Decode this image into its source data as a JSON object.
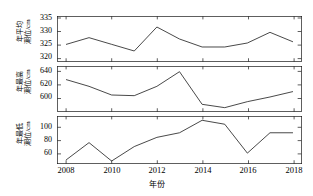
{
  "figure": {
    "xaxis_title": "年份",
    "background_color": "#ffffff",
    "line_color": "#1a1a1a"
  },
  "chart_data": [
    {
      "type": "line",
      "title": "",
      "panel_index": 1,
      "ylabel_line1": "年平均",
      "ylabel_line2": "潮位/cm",
      "ylabel": "年平均潮位/cm",
      "xlabel": "年份",
      "x": [
        2008,
        2009,
        2010,
        2011,
        2012,
        2013,
        2014,
        2015,
        2016,
        2017,
        2018
      ],
      "values": [
        325.5,
        328.0,
        325.5,
        323.0,
        332.0,
        327.5,
        324.5,
        324.5,
        326.0,
        330.0,
        326.5
      ],
      "xlim": [
        2007.6,
        2018.4
      ],
      "ylim": [
        319.0,
        336.0
      ],
      "yticks": [
        320,
        325,
        330,
        335
      ],
      "ytick_labels": [
        "320",
        "325",
        "330",
        "335"
      ],
      "xticks": [
        2008,
        2010,
        2012,
        2014,
        2016,
        2018
      ],
      "xtick_labels": [
        "2008",
        "2010",
        "2012",
        "2014",
        "2016",
        "2018"
      ],
      "grid": false,
      "legend": false
    },
    {
      "type": "line",
      "title": "",
      "panel_index": 2,
      "ylabel_line1": "年最高",
      "ylabel_line2": "潮位/cm",
      "ylabel": "年最高潮位/cm",
      "xlabel": "年份",
      "x": [
        2008,
        2009,
        2010,
        2011,
        2012,
        2013,
        2014,
        2015,
        2016,
        2017,
        2018
      ],
      "values": [
        628,
        618,
        605,
        604,
        618,
        640,
        591,
        586,
        595,
        602,
        610
      ],
      "xlim": [
        2007.6,
        2018.4
      ],
      "ylim": [
        580,
        648
      ],
      "yticks": [
        600,
        620,
        640
      ],
      "ytick_labels": [
        "600",
        "620",
        "640"
      ],
      "xticks": [
        2008,
        2010,
        2012,
        2014,
        2016,
        2018
      ],
      "xtick_labels": [
        "2008",
        "2010",
        "2012",
        "2014",
        "2016",
        "2018"
      ],
      "grid": false,
      "legend": false
    },
    {
      "type": "line",
      "title": "",
      "panel_index": 3,
      "ylabel_line1": "年最低",
      "ylabel_line2": "潮位/cm",
      "ylabel": "年最低潮位/cm",
      "xlabel": "年份",
      "x": [
        2008,
        2009,
        2010,
        2011,
        2012,
        2013,
        2014,
        2015,
        2016,
        2017,
        2018
      ],
      "values": [
        52,
        78,
        50,
        72,
        86,
        93,
        112,
        106,
        62,
        93,
        93
      ],
      "xlim": [
        2007.6,
        2018.4
      ],
      "ylim": [
        46,
        118
      ],
      "yticks": [
        60,
        80,
        100
      ],
      "ytick_labels": [
        "60",
        "80",
        "100"
      ],
      "xticks": [
        2008,
        2010,
        2012,
        2014,
        2016,
        2018
      ],
      "xtick_labels": [
        "2008",
        "2010",
        "2012",
        "2014",
        "2016",
        "2018"
      ],
      "grid": false,
      "legend": false
    }
  ]
}
